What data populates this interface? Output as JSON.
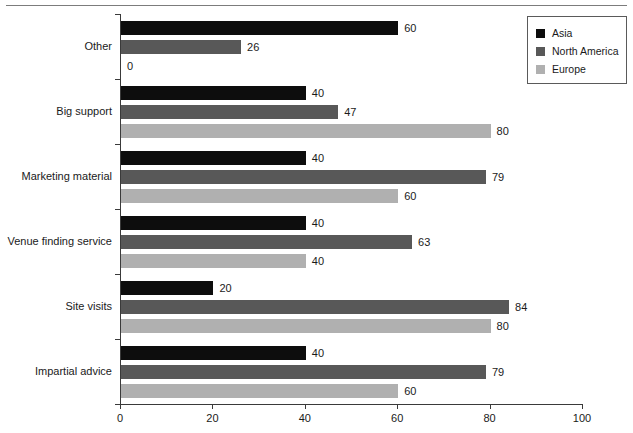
{
  "chart_data": {
    "type": "bar",
    "orientation": "horizontal",
    "title": "",
    "xlabel": "",
    "ylabel": "",
    "xlim": [
      0,
      100
    ],
    "xticks": [
      0,
      20,
      40,
      60,
      80,
      100
    ],
    "grid": false,
    "legend_position": "top-right",
    "categories": [
      "Other",
      "Big support",
      "Marketing material",
      "Venue finding service",
      "Site visits",
      "Impartial advice"
    ],
    "series": [
      {
        "name": "Asia",
        "color": "#0d0d0d",
        "values": [
          60,
          40,
          40,
          40,
          20,
          40
        ]
      },
      {
        "name": "North America",
        "color": "#585858",
        "values": [
          26,
          47,
          79,
          63,
          84,
          79
        ]
      },
      {
        "name": "Europe",
        "color": "#b0b0b0",
        "values": [
          0,
          80,
          60,
          40,
          80,
          60
        ]
      }
    ]
  },
  "legend": {
    "entries": [
      {
        "label": "Asia",
        "color": "#0d0d0d"
      },
      {
        "label": "North America",
        "color": "#585858"
      },
      {
        "label": "Europe",
        "color": "#b0b0b0"
      }
    ]
  },
  "axis": {
    "x_tick_labels": [
      "0",
      "20",
      "40",
      "60",
      "80",
      "100"
    ]
  },
  "top_crop": {
    "ghost_text": ""
  }
}
